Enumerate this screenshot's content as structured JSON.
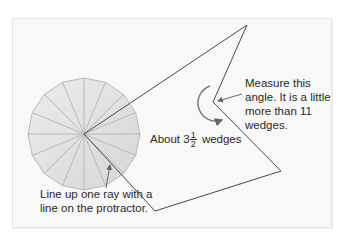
{
  "figure": {
    "background": "#f8f8f8",
    "line_color": "#4a4a4a",
    "protractor": {
      "wedges": 16,
      "fill": "#e2e2e2",
      "stroke": "#b5b5b5",
      "center": [
        84,
        134
      ],
      "radius": 56
    },
    "angle_shape": {
      "points": [
        [
          84,
          134
        ],
        [
          247,
          25
        ],
        [
          213,
          102
        ],
        [
          281,
          171
        ],
        [
          155,
          211
        ]
      ]
    }
  },
  "labels": {
    "measure": "Measure this angle. It is a little more than 11 wedges.",
    "about_prefix": "About 3",
    "about_frac_num": "1",
    "about_frac_den": "2",
    "about_suffix": "wedges",
    "line_up": "Line up one ray with a line on the protractor."
  }
}
